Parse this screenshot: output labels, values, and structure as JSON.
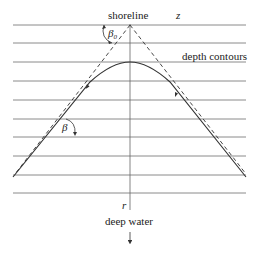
{
  "labels": {
    "shoreline": "shoreline",
    "z_axis": "z",
    "depth_contours": "depth contours",
    "beta0_symbol": "β",
    "beta0_subscript": "0",
    "beta": "β",
    "r_axis": "r",
    "deep_water": "deep water"
  },
  "colors": {
    "contour": "#8a8a8a",
    "ray": "#333333",
    "axis": "#666666",
    "text": "#222222"
  }
}
